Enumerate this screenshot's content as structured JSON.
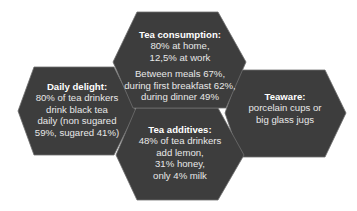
{
  "colors": {
    "hex_fill": "#3d3d3d",
    "hex_stroke": "#6e6e6e",
    "text": "#e8e8e8",
    "title_text": "#ffffff",
    "background": "#ffffff"
  },
  "hexagons": {
    "consumption": {
      "title": "Tea consumption:",
      "lines": [
        "80% at home,",
        "12,5% at work"
      ],
      "lines2": [
        "Between meals 67%,",
        "during first breakfast 62%,",
        "during dinner 49%"
      ]
    },
    "daily": {
      "title": "Daily delight:",
      "lines": [
        "80% of tea drinkers",
        "drink black tea",
        "daily (non sugared",
        "59%, sugared 41%)"
      ]
    },
    "additives": {
      "title": "Tea additives:",
      "lines": [
        "48% of tea drinkers",
        "add lemon,",
        "31% honey,",
        "only 4% milk"
      ]
    },
    "teaware": {
      "title": "Teaware:",
      "lines": [
        "porcelain cups or",
        "big glass jugs"
      ]
    }
  }
}
